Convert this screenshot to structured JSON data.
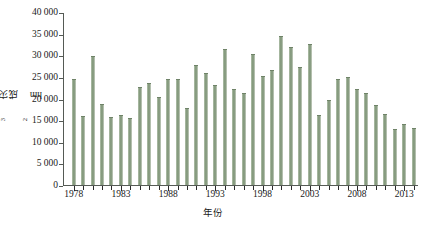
{
  "chart_data": {
    "type": "bar",
    "title": "",
    "xlabel": "年份",
    "ylabel": "成灾面积/10³hm²",
    "ylabel_main": "成灾面积/10",
    "ylabel_exp": "3",
    "ylabel_unit": "hm",
    "ylabel_unit_exp": "2",
    "ylim": [
      0,
      40000
    ],
    "ytick_values": [
      0,
      5000,
      10000,
      15000,
      20000,
      25000,
      30000,
      35000,
      40000
    ],
    "ytick_labels": [
      "0",
      "5 000",
      "10 000",
      "15 000",
      "20 000",
      "25 000",
      "30 000",
      "35 000",
      "40 000"
    ],
    "xtick_labels": [
      "1978",
      "1983",
      "1988",
      "1993",
      "1998",
      "2003",
      "2008",
      "2013"
    ],
    "xlim_years": [
      1978,
      2014
    ],
    "grid": false,
    "legend": "none",
    "bar_color": "#8ba083",
    "axis_color": "#555a55",
    "categories": [
      "1978",
      "1979",
      "1980",
      "1981",
      "1982",
      "1983",
      "1984",
      "1985",
      "1986",
      "1987",
      "1988",
      "1989",
      "1990",
      "1991",
      "1992",
      "1993",
      "1994",
      "1995",
      "1996",
      "1997",
      "1998",
      "1999",
      "2000",
      "2001",
      "2002",
      "2003",
      "2004",
      "2005",
      "2006",
      "2007",
      "2008",
      "2009",
      "2010",
      "2011",
      "2012",
      "2013",
      "2014"
    ],
    "values": [
      24500,
      15900,
      29800,
      18700,
      15800,
      16100,
      15600,
      22700,
      23700,
      20400,
      24500,
      24500,
      17800,
      27800,
      25900,
      23100,
      31400,
      22200,
      21200,
      30300,
      25200,
      26700,
      34400,
      31800,
      27200,
      32500,
      16300,
      19600,
      24600,
      25000,
      22200,
      21200,
      18500,
      16500,
      12900,
      14200,
      13200
    ]
  }
}
